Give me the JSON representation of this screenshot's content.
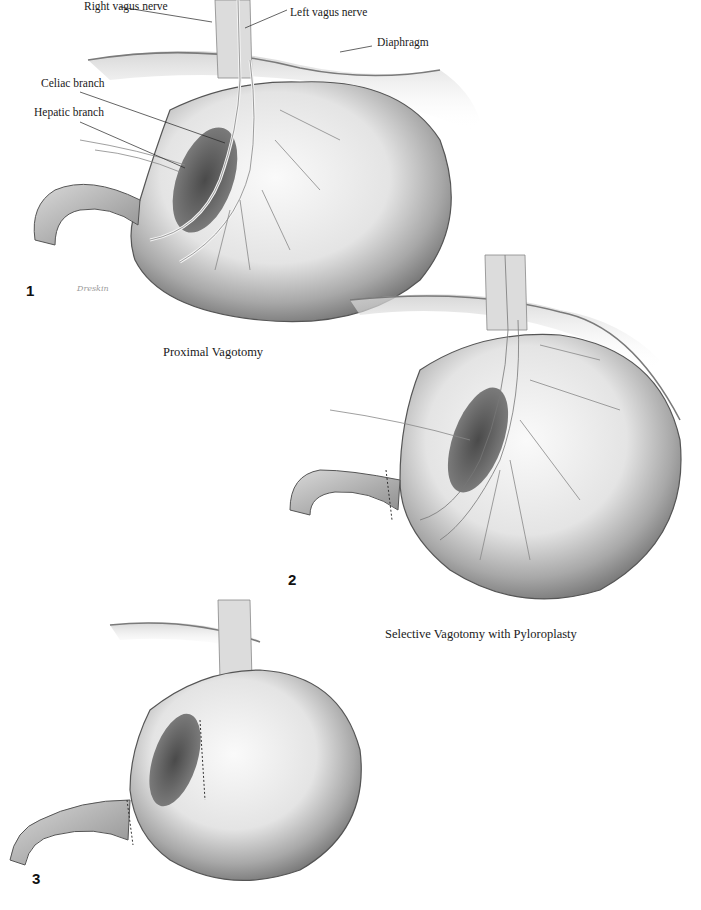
{
  "figures": [
    {
      "number": "1",
      "caption": "Proximal Vagotomy",
      "signature": "Dreskin",
      "labels": {
        "right_vagus": "Right vagus nerve",
        "left_vagus": "Left vagus nerve",
        "diaphragm": "Diaphragm",
        "celiac": "Celiac branch",
        "hepatic": "Hepatic branch"
      }
    },
    {
      "number": "2",
      "caption": "Selective Vagotomy with Pyloroplasty"
    },
    {
      "number": "3",
      "caption": ""
    }
  ],
  "colors": {
    "paper": "#ffffff",
    "ink": "#1a1a1a",
    "stomach_light": "#f2f2f2",
    "stomach_mid": "#bdbdbd",
    "stomach_dark": "#6e6e6e",
    "nerve": "#e8e8e8"
  }
}
